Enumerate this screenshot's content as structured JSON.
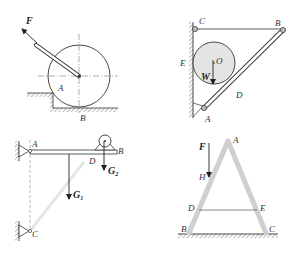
{
  "figure": {
    "panels": [
      {
        "id": "a",
        "description": "Cylinder pushed against step by force F on handle",
        "labels": {
          "force": "F",
          "point_a": "A",
          "point_b": "B"
        }
      },
      {
        "id": "b",
        "description": "Sphere between wall and strut AB held by cable CB",
        "labels": {
          "c": "C",
          "b": "B",
          "e": "E",
          "o": "O",
          "w": "W",
          "d": "D",
          "a": "A"
        }
      },
      {
        "id": "c",
        "description": "Horizontal beam AB pinned at A with strut to C, pulley at D",
        "labels": {
          "a": "A",
          "b": "B",
          "d": "D",
          "c": "C",
          "g1": "G",
          "g1_sub": "1",
          "g2": "G",
          "g2_sub": "2"
        }
      },
      {
        "id": "d",
        "description": "A-frame ladder with tie DE and load F at H",
        "labels": {
          "a": "A",
          "f": "F",
          "h": "H",
          "d": "D",
          "e": "E",
          "b": "B",
          "c": "C"
        }
      }
    ],
    "colors": {
      "line": "#333333",
      "member_fill": "#d6d6d6",
      "sphere_fill": "#e4e4e4",
      "hatch": "#555555"
    }
  }
}
